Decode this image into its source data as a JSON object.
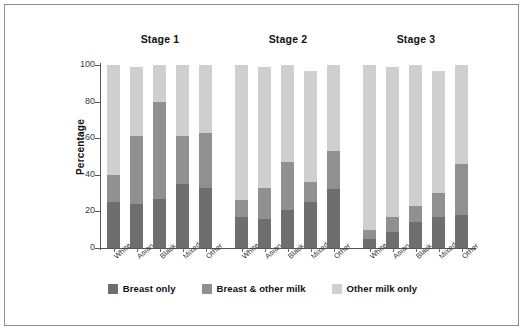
{
  "chart_data": {
    "type": "bar",
    "title": "",
    "subtitle": "",
    "xlabel": "",
    "ylabel": "Percentage",
    "ylim": [
      0,
      100
    ],
    "yticks": [
      0,
      20,
      40,
      60,
      80,
      100
    ],
    "grid": false,
    "stacked": true,
    "legend_position": "bottom",
    "group_labels": [
      "Stage 1",
      "Stage 2",
      "Stage 3"
    ],
    "categories": [
      "White",
      "Asian",
      "Black",
      "Mixed",
      "Other"
    ],
    "series": [
      {
        "name": "Breast only",
        "color": "#6e6e6e",
        "values_by_group": {
          "Stage 1": [
            25,
            24,
            27,
            35,
            33
          ],
          "Stage 2": [
            17,
            16,
            21,
            25,
            32
          ],
          "Stage 3": [
            5,
            9,
            14,
            17,
            18
          ]
        }
      },
      {
        "name": "Breast & other milk",
        "color": "#909090",
        "values_by_group": {
          "Stage 1": [
            15,
            37,
            53,
            26,
            30
          ],
          "Stage 2": [
            9,
            17,
            26,
            11,
            21
          ],
          "Stage 3": [
            5,
            8,
            9,
            13,
            28
          ]
        }
      },
      {
        "name": "Other milk only",
        "color": "#cfcfcf",
        "values_by_group": {
          "Stage 1": [
            60,
            38,
            20,
            39,
            37
          ],
          "Stage 2": [
            74,
            66,
            53,
            61,
            47
          ],
          "Stage 3": [
            90,
            82,
            77,
            67,
            54
          ]
        }
      }
    ],
    "cumulative_tops": {
      "Stage 1": [
        {
          "category": "White",
          "breast_only": 25,
          "breast_and_other": 40,
          "total": 100
        },
        {
          "category": "Asian",
          "breast_only": 24,
          "breast_and_other": 61,
          "total": 99
        },
        {
          "category": "Black",
          "breast_only": 27,
          "breast_and_other": 80,
          "total": 100
        },
        {
          "category": "Mixed",
          "breast_only": 35,
          "breast_and_other": 61,
          "total": 100
        },
        {
          "category": "Other",
          "breast_only": 33,
          "breast_and_other": 63,
          "total": 100
        }
      ],
      "Stage 2": [
        {
          "category": "White",
          "breast_only": 17,
          "breast_and_other": 26,
          "total": 100
        },
        {
          "category": "Asian",
          "breast_only": 16,
          "breast_and_other": 33,
          "total": 99
        },
        {
          "category": "Black",
          "breast_only": 21,
          "breast_and_other": 47,
          "total": 100
        },
        {
          "category": "Mixed",
          "breast_only": 25,
          "breast_and_other": 36,
          "total": 97
        },
        {
          "category": "Other",
          "breast_only": 32,
          "breast_and_other": 53,
          "total": 100
        }
      ],
      "Stage 3": [
        {
          "category": "White",
          "breast_only": 5,
          "breast_and_other": 10,
          "total": 100
        },
        {
          "category": "Asian",
          "breast_only": 9,
          "breast_and_other": 17,
          "total": 99
        },
        {
          "category": "Black",
          "breast_only": 14,
          "breast_and_other": 23,
          "total": 100
        },
        {
          "category": "Mixed",
          "breast_only": 17,
          "breast_and_other": 30,
          "total": 97
        },
        {
          "category": "Other",
          "breast_only": 18,
          "breast_and_other": 46,
          "total": 100
        }
      ]
    }
  },
  "axis": {
    "y_title": "Percentage",
    "y_tick_labels": [
      "100",
      "80",
      "60",
      "40",
      "20",
      "0"
    ]
  },
  "groups": [
    {
      "title": "Stage 1",
      "labels": [
        "White",
        "Asian",
        "Black",
        "Mixed",
        "Other"
      ]
    },
    {
      "title": "Stage 2",
      "labels": [
        "White",
        "Asian",
        "Black",
        "Mixed",
        "Other"
      ]
    },
    {
      "title": "Stage 3",
      "labels": [
        "White",
        "Asian",
        "Black",
        "Mixed",
        "Other"
      ]
    }
  ],
  "legend": {
    "items": [
      {
        "label": "Breast only",
        "color": "#6e6e6e"
      },
      {
        "label": "Breast & other milk",
        "color": "#909090"
      },
      {
        "label": "Other milk only",
        "color": "#cfcfcf"
      }
    ]
  },
  "colors": {
    "breast_only": "#6e6e6e",
    "breast_and_other_milk": "#909090",
    "other_milk_only": "#cfcfcf",
    "axis": "#555555",
    "frame": "#8d8d8d",
    "background": "#ffffff"
  }
}
